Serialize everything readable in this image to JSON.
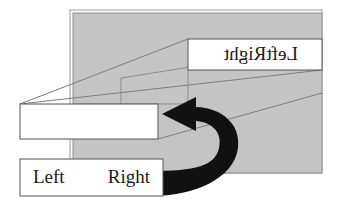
{
  "figure": {
    "colors": {
      "panel_fill": "#c4c4c4",
      "panel_stroke": "#8a8a8a",
      "box_fill": "#ffffff",
      "box_stroke": "#6b6b6b",
      "arrow_fill": "#111111",
      "text": "#1a1a1a",
      "background": "#ffffff"
    }
  },
  "back_panel": {
    "name": "gray-slab",
    "x": 70,
    "y": 10,
    "width": 252,
    "height": 163
  },
  "top_box": {
    "mirrored": true,
    "labels": [
      {
        "text": "Right"
      },
      {
        "text": "Left"
      }
    ]
  },
  "middle_box": {
    "labels": []
  },
  "bottom_box": {
    "mirrored": false,
    "labels": [
      {
        "text": "Left"
      },
      {
        "text": "Right"
      }
    ]
  },
  "arrow": {
    "name": "rotate-flip-arrow",
    "direction": "counter-clockwise-left",
    "label": ""
  }
}
